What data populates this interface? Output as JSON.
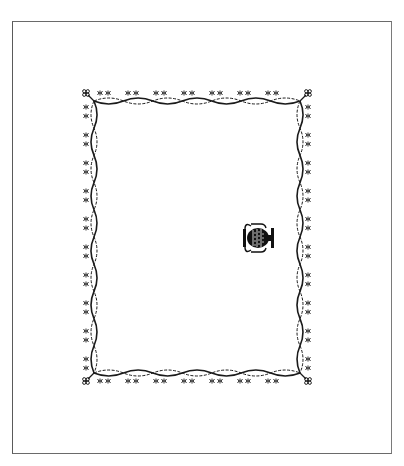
{
  "page": {
    "type": "scanned-blank-page",
    "background_color": "#ffffff",
    "page_border_color": "#6a6a6a"
  },
  "frame": {
    "style": "ornamental twisted-rope border with floral motifs",
    "ink_color": "#1a1a1a",
    "motif_icon": "floral-knot-icon",
    "corner_icon": "rosette-icon",
    "x": 82,
    "y": 89,
    "width": 230,
    "height": 296,
    "rope_inset": 12,
    "twist_period": 28
  },
  "illustration": {
    "icon": "vase-icon",
    "description": "ornate urn rotated 90 degrees",
    "x": 241,
    "y": 220,
    "width": 37,
    "height": 36
  }
}
